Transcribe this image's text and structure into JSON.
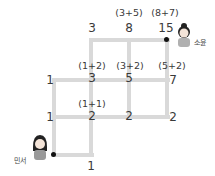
{
  "diagram": {
    "start": {
      "name": "민서"
    },
    "end": {
      "name": "소윤"
    },
    "nodes": [
      {
        "id": "n_top_1",
        "value": "3",
        "expr": ""
      },
      {
        "id": "n_top_2",
        "value": "8",
        "expr": "(3+5)"
      },
      {
        "id": "n_top_3",
        "value": "15",
        "expr": "(8+7)"
      },
      {
        "id": "n_mid_0",
        "value": "1",
        "expr": ""
      },
      {
        "id": "n_mid_1",
        "value": "3",
        "expr": "(1+2)"
      },
      {
        "id": "n_mid_2",
        "value": "5",
        "expr": "(3+2)"
      },
      {
        "id": "n_mid_3",
        "value": "7",
        "expr": "(5+2)"
      },
      {
        "id": "n_low_0",
        "value": "1",
        "expr": ""
      },
      {
        "id": "n_low_1",
        "value": "2",
        "expr": "(1+1)"
      },
      {
        "id": "n_low_2",
        "value": "2",
        "expr": ""
      },
      {
        "id": "n_low_3",
        "value": "2",
        "expr": ""
      },
      {
        "id": "n_bot_1",
        "value": "1",
        "expr": ""
      }
    ],
    "colors": {
      "grid": "#d9d9d9",
      "text": "#3a3a3a",
      "dot": "#111111"
    }
  }
}
